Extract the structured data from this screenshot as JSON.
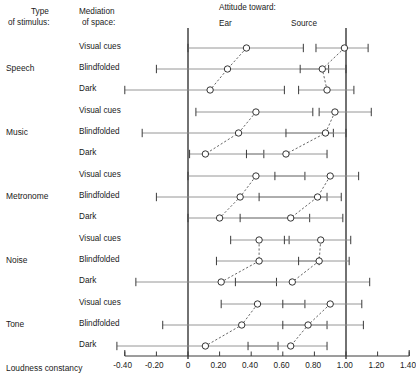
{
  "header": {
    "col_type_line1": "Type",
    "col_type_line2": "of stimulus:",
    "col_mediation_line1": "Mediation",
    "col_mediation_line2": "of space:",
    "attitude_title": "Attitude toward:",
    "series_ear": "Ear",
    "series_source": "Source"
  },
  "axis": {
    "title": "Loudness constancy",
    "ticks": [
      "-0.40",
      "-0.20",
      "0",
      "0.20",
      "0.40",
      "0.60",
      "0.80",
      "1.00",
      "1.20",
      "1.40"
    ],
    "tick_values": [
      -0.4,
      -0.2,
      0,
      0.2,
      0.4,
      0.6,
      0.8,
      1.0,
      1.2,
      1.4
    ],
    "xlim": [
      -0.4,
      1.4
    ],
    "reference_lines": [
      0,
      1.0
    ]
  },
  "mediation_labels": [
    "Visual cues",
    "Blindfolded",
    "Dark"
  ],
  "groups": [
    "Speech",
    "Music",
    "Metronome",
    "Noise",
    "Tone"
  ],
  "colors": {
    "ink": "#1d1d1d",
    "whisker": "#8a8a8a",
    "marker_fill": "#ffffff",
    "connector": "#4a4a4a"
  },
  "chart_data": {
    "type": "scatter",
    "xlabel": "Loudness constancy",
    "ylabel": "",
    "xlim": [
      -0.4,
      1.4
    ],
    "grid": false,
    "legend_position": "top",
    "reference_lines": [
      0,
      1.0
    ],
    "series": [
      {
        "name": "Ear",
        "note": "left cluster, mean with range whiskers"
      },
      {
        "name": "Source",
        "note": "right cluster, mean with range whiskers"
      }
    ],
    "groups": [
      {
        "stimulus": "Speech",
        "rows": [
          {
            "mediation": "Visual cues",
            "ear": {
              "mean": 0.37,
              "low": 0.0,
              "high": 0.73
            },
            "source": {
              "mean": 0.99,
              "low": 0.81,
              "high": 1.14
            }
          },
          {
            "mediation": "Blindfolded",
            "ear": {
              "mean": 0.25,
              "low": -0.2,
              "high": 0.89
            },
            "source": {
              "mean": 0.85,
              "low": 0.71,
              "high": 1.0
            }
          },
          {
            "mediation": "Dark",
            "ear": {
              "mean": 0.14,
              "low": -0.4,
              "high": 0.61
            },
            "source": {
              "mean": 0.88,
              "low": 0.7,
              "high": 1.05
            }
          }
        ]
      },
      {
        "stimulus": "Music",
        "rows": [
          {
            "mediation": "Visual cues",
            "ear": {
              "mean": 0.43,
              "low": 0.05,
              "high": 0.79
            },
            "source": {
              "mean": 0.93,
              "low": 0.83,
              "high": 1.16
            }
          },
          {
            "mediation": "Blindfolded",
            "ear": {
              "mean": 0.32,
              "low": -0.29,
              "high": 0.92
            },
            "source": {
              "mean": 0.87,
              "low": 0.62,
              "high": 1.0
            }
          },
          {
            "mediation": "Dark",
            "ear": {
              "mean": 0.11,
              "low": 0.01,
              "high": 0.48
            },
            "source": {
              "mean": 0.62,
              "low": 0.37,
              "high": 0.88
            }
          }
        ]
      },
      {
        "stimulus": "Metronome",
        "rows": [
          {
            "mediation": "Visual cues",
            "ear": {
              "mean": 0.43,
              "low": 0.0,
              "high": 0.74
            },
            "source": {
              "mean": 0.9,
              "low": 0.55,
              "high": 1.08
            }
          },
          {
            "mediation": "Blindfolded",
            "ear": {
              "mean": 0.33,
              "low": -0.2,
              "high": 0.88
            },
            "source": {
              "mean": 0.82,
              "low": 0.45,
              "high": 0.97
            }
          },
          {
            "mediation": "Dark",
            "ear": {
              "mean": 0.2,
              "low": 0.0,
              "high": 0.77
            },
            "source": {
              "mean": 0.65,
              "low": 0.33,
              "high": 0.98
            }
          }
        ]
      },
      {
        "stimulus": "Noise",
        "rows": [
          {
            "mediation": "Visual cues",
            "ear": {
              "mean": 0.45,
              "low": 0.27,
              "high": 0.64
            },
            "source": {
              "mean": 0.84,
              "low": 0.61,
              "high": 1.03
            }
          },
          {
            "mediation": "Blindfolded",
            "ear": {
              "mean": 0.45,
              "low": 0.18,
              "high": 0.83
            },
            "source": {
              "mean": 0.83,
              "low": 0.7,
              "high": 1.02
            }
          },
          {
            "mediation": "Dark",
            "ear": {
              "mean": 0.21,
              "low": -0.33,
              "high": 0.56
            },
            "source": {
              "mean": 0.66,
              "low": 0.3,
              "high": 1.15
            }
          }
        ]
      },
      {
        "stimulus": "Tone",
        "rows": [
          {
            "mediation": "Visual cues",
            "ear": {
              "mean": 0.44,
              "low": 0.21,
              "high": 0.74
            },
            "source": {
              "mean": 0.9,
              "low": 0.6,
              "high": 1.1
            }
          },
          {
            "mediation": "Blindfolded",
            "ear": {
              "mean": 0.34,
              "low": -0.16,
              "high": 0.88
            },
            "source": {
              "mean": 0.76,
              "low": 0.6,
              "high": 1.11
            }
          },
          {
            "mediation": "Dark",
            "ear": {
              "mean": 0.11,
              "low": -0.45,
              "high": 0.57
            },
            "source": {
              "mean": 0.65,
              "low": 0.38,
              "high": 0.88
            }
          }
        ]
      }
    ]
  }
}
